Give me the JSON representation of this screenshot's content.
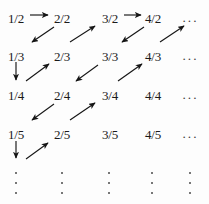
{
  "figure": {
    "ink_color": "#151515",
    "background_color": "#fdfdfd"
  },
  "grid": {
    "rows": [
      {
        "row_label": "denominator 2",
        "cells": [
          {
            "text": "1/2",
            "x": 8,
            "y": 12
          },
          {
            "text": "2/2",
            "x": 54,
            "y": 12
          },
          {
            "text": "3/2",
            "x": 102,
            "y": 12
          },
          {
            "text": "4/2",
            "x": 145,
            "y": 12
          }
        ],
        "tail": {
          "text": "···",
          "x": 182,
          "y": 14
        }
      },
      {
        "row_label": "denominator 3",
        "cells": [
          {
            "text": "1/3",
            "x": 8,
            "y": 50
          },
          {
            "text": "2/3",
            "x": 54,
            "y": 50
          },
          {
            "text": "3/3",
            "x": 102,
            "y": 50
          },
          {
            "text": "4/3",
            "x": 145,
            "y": 50
          }
        ],
        "tail": {
          "text": "···",
          "x": 182,
          "y": 52
        }
      },
      {
        "row_label": "denominator 4",
        "cells": [
          {
            "text": "1/4",
            "x": 8,
            "y": 89
          },
          {
            "text": "2/4",
            "x": 54,
            "y": 89
          },
          {
            "text": "3/4",
            "x": 102,
            "y": 89
          },
          {
            "text": "4/4",
            "x": 145,
            "y": 89
          }
        ],
        "tail": {
          "text": "···",
          "x": 182,
          "y": 91
        }
      },
      {
        "row_label": "denominator 5",
        "cells": [
          {
            "text": "1/5",
            "x": 8,
            "y": 128
          },
          {
            "text": "2/5",
            "x": 54,
            "y": 128
          },
          {
            "text": "3/5",
            "x": 102,
            "y": 128
          },
          {
            "text": "4/5",
            "x": 145,
            "y": 128
          }
        ],
        "tail": {
          "text": "···",
          "x": 182,
          "y": 130
        }
      }
    ],
    "bottom_dots": [
      {
        "name": "column-1-vertical-ellipsis",
        "x": 14,
        "y": 172
      },
      {
        "name": "column-2-vertical-ellipsis",
        "x": 60,
        "y": 172
      },
      {
        "name": "column-3-vertical-ellipsis",
        "x": 107,
        "y": 172
      },
      {
        "name": "column-4-vertical-ellipsis",
        "x": 150,
        "y": 172
      },
      {
        "name": "column-5-vertical-ellipsis",
        "x": 188,
        "y": 172
      }
    ]
  },
  "arrows": [
    {
      "name": "arrow-1-2-to-2-2-right",
      "from": "1/2",
      "to": "2/2",
      "direction": "right",
      "x1": 30,
      "y1": 15,
      "x2": 48,
      "y2": 15
    },
    {
      "name": "arrow-3-2-to-4-2-right",
      "from": "3/2",
      "to": "4/2",
      "direction": "right",
      "x1": 124,
      "y1": 15,
      "x2": 141,
      "y2": 15
    },
    {
      "name": "arrow-2-2-to-1-3-downleft",
      "from": "2/2",
      "to": "1/3",
      "direction": "down-left",
      "x1": 54,
      "y1": 27,
      "x2": 32,
      "y2": 42
    },
    {
      "name": "arrow-2-3-to-3-2-upright",
      "from": "2/3",
      "to": "3/2",
      "direction": "up-right",
      "x1": 70,
      "y1": 42,
      "x2": 95,
      "y2": 26
    },
    {
      "name": "arrow-4-2-to-3-3-downleft",
      "from": "4/2",
      "to": "3/3",
      "direction": "down-left",
      "x1": 144,
      "y1": 27,
      "x2": 122,
      "y2": 42
    },
    {
      "name": "arrow-4-3-to-next-upright",
      "from": "4/3",
      "to": "5/2",
      "direction": "up-right",
      "x1": 160,
      "y1": 42,
      "x2": 184,
      "y2": 26
    },
    {
      "name": "arrow-1-3-to-1-4-down",
      "from": "1/3",
      "to": "1/4",
      "direction": "down",
      "x1": 16,
      "y1": 62,
      "x2": 16,
      "y2": 80
    },
    {
      "name": "arrow-1-4-to-2-3-upright",
      "from": "1/4",
      "to": "2/3",
      "direction": "up-right",
      "x1": 26,
      "y1": 81,
      "x2": 49,
      "y2": 64
    },
    {
      "name": "arrow-3-3-to-2-4-downleft",
      "from": "3/3",
      "to": "2/4",
      "direction": "down-left",
      "x1": 98,
      "y1": 65,
      "x2": 76,
      "y2": 81
    },
    {
      "name": "arrow-3-4-to-4-3-upright",
      "from": "3/4",
      "to": "4/3",
      "direction": "up-right",
      "x1": 118,
      "y1": 81,
      "x2": 142,
      "y2": 64
    },
    {
      "name": "arrow-2-4-to-1-5-downleft",
      "from": "2/4",
      "to": "1/5",
      "direction": "down-left",
      "x1": 54,
      "y1": 104,
      "x2": 32,
      "y2": 120
    },
    {
      "name": "arrow-2-5-to-3-4-upright",
      "from": "2/5",
      "to": "3/4",
      "direction": "up-right",
      "x1": 70,
      "y1": 120,
      "x2": 95,
      "y2": 103
    },
    {
      "name": "arrow-1-5-to-1-6-down",
      "from": "1/5",
      "to": "1/6",
      "direction": "down",
      "x1": 16,
      "y1": 141,
      "x2": 16,
      "y2": 158
    },
    {
      "name": "arrow-1-6-to-2-5-upright",
      "from": "1/6",
      "to": "2/5",
      "direction": "up-right",
      "x1": 26,
      "y1": 159,
      "x2": 48,
      "y2": 143
    }
  ]
}
